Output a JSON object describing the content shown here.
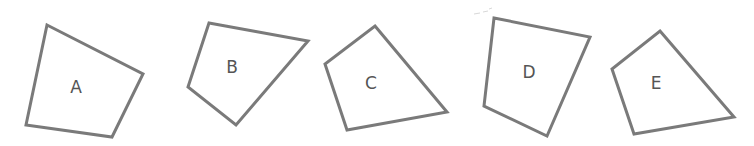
{
  "diagram": {
    "type": "quadrilaterals",
    "stroke_color": "#7a7a7a",
    "label_color": "#555555",
    "background": "#ffffff",
    "shapes": [
      {
        "id": "A",
        "label": "A",
        "points": "47,25 143,74 112,137 26,125",
        "label_x": 76,
        "label_y": 88
      },
      {
        "id": "B",
        "label": "B",
        "points": "209,23 308,41 236,125 188,87",
        "label_x": 232,
        "label_y": 68
      },
      {
        "id": "C",
        "label": "C",
        "points": "375,26 447,112 347,130 325,64",
        "label_x": 371,
        "label_y": 84
      },
      {
        "id": "D",
        "label": "D",
        "points": "494,18 590,37 547,136 484,106",
        "label_x": 529,
        "label_y": 73
      },
      {
        "id": "E",
        "label": "E",
        "points": "660,31 734,117 634,134 612,69",
        "label_x": 656,
        "label_y": 84
      }
    ]
  }
}
